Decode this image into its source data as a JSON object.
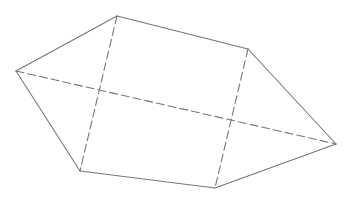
{
  "diagram": {
    "type": "polyhedron-wireframe",
    "background": "#ffffff",
    "stroke_color": "#777777",
    "stroke_width": 1.1,
    "dash_pattern": "8 4",
    "vertices": {
      "L": {
        "x": 16,
        "y": 71
      },
      "T": {
        "x": 117,
        "y": 16
      },
      "TR": {
        "x": 248,
        "y": 49
      },
      "R": {
        "x": 336,
        "y": 144
      },
      "BR": {
        "x": 215,
        "y": 188
      },
      "BL": {
        "x": 80,
        "y": 171
      }
    },
    "solid_edges": [
      [
        "L",
        "T"
      ],
      [
        "T",
        "TR"
      ],
      [
        "TR",
        "R"
      ],
      [
        "R",
        "BR"
      ],
      [
        "BR",
        "BL"
      ],
      [
        "BL",
        "L"
      ]
    ],
    "dashed_edges": [
      [
        "T",
        "BL"
      ],
      [
        "TR",
        "BR"
      ],
      [
        "L",
        "R"
      ]
    ]
  }
}
